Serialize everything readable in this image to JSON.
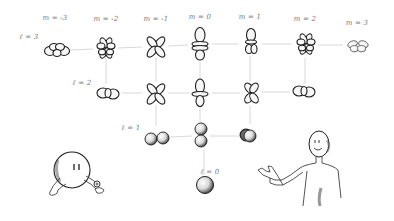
{
  "diagram": {
    "title": "",
    "column_labels": [
      {
        "text": "m = -3",
        "m": -3
      },
      {
        "text": "m = -2",
        "m": -2
      },
      {
        "text": "m = -1",
        "m": -1
      },
      {
        "text": "m = 0",
        "m": 0
      },
      {
        "text": "m = 1",
        "m": 1
      },
      {
        "text": "m = 2",
        "m": 2
      },
      {
        "text": "m = 3",
        "m": 3
      }
    ],
    "row_labels": [
      {
        "text": "ℓ = 3",
        "l": 3
      },
      {
        "text": "ℓ = 2",
        "l": 2
      },
      {
        "text": "ℓ = 1",
        "l": 1
      },
      {
        "text": "ℓ = 0",
        "l": 0
      }
    ],
    "rows": [
      {
        "l": 3,
        "orbitals": [
          {
            "m": -3,
            "shape": "f-horizontal-lobes"
          },
          {
            "m": -2,
            "shape": "f-clover-8-lobe"
          },
          {
            "m": -1,
            "shape": "f-clover-4-lobe"
          },
          {
            "m": 0,
            "shape": "f-z3-with-two-rings"
          },
          {
            "m": 1,
            "shape": "f-vertical-with-ring"
          },
          {
            "m": 2,
            "shape": "f-clover-8-lobe"
          },
          {
            "m": 3,
            "shape": "f-horizontal-lobes"
          }
        ]
      },
      {
        "l": 2,
        "orbitals": [
          {
            "m": -2,
            "shape": "d-horizontal-lobes"
          },
          {
            "m": -1,
            "shape": "d-clover"
          },
          {
            "m": 0,
            "shape": "d-z2-with-ring"
          },
          {
            "m": 1,
            "shape": "d-clover-tilted"
          },
          {
            "m": 2,
            "shape": "d-horizontal-lobes"
          }
        ]
      },
      {
        "l": 1,
        "orbitals": [
          {
            "m": -1,
            "shape": "p-horizontal-dumbbell"
          },
          {
            "m": 0,
            "shape": "p-vertical-dumbbell"
          },
          {
            "m": 1,
            "shape": "p-end-on-dumbbell"
          }
        ]
      },
      {
        "l": 0,
        "orbitals": [
          {
            "m": 0,
            "shape": "s-sphere"
          }
        ]
      }
    ],
    "characters": [
      {
        "name": "blob-character",
        "description": "round-headed creature with two dot eyes, leaning on its arms, holding a small plus-sign (proton) ball"
      },
      {
        "name": "pointing-person",
        "description": "bald smiling stick-figure person pointing toward the orbitals"
      }
    ],
    "colors": {
      "ink": "#1e1e1e",
      "guide_lines": "#d4d4d4",
      "label_text": "#7a7a7a",
      "background": "#ffffff"
    }
  }
}
